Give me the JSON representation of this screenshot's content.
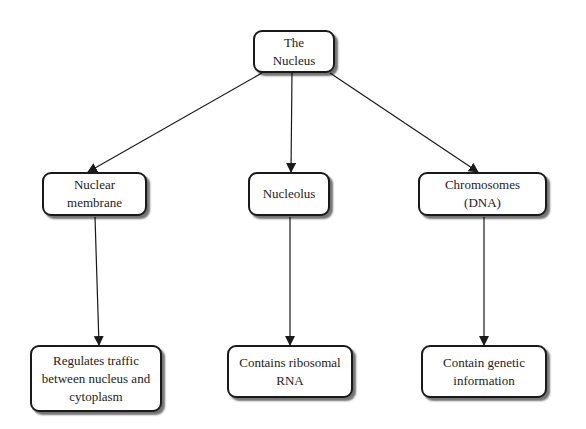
{
  "diagram": {
    "type": "tree",
    "root": {
      "id": "nucleus",
      "label": "The Nucleus"
    },
    "level1": [
      {
        "id": "membrane",
        "label": "Nuclear membrane"
      },
      {
        "id": "nucleolus",
        "label": "Nucleolus"
      },
      {
        "id": "chromosomes",
        "label": "Chromosomes (DNA)"
      }
    ],
    "level2": [
      {
        "id": "membrane-desc",
        "parent": "membrane",
        "label": "Regulates traffic\nbetween nucleus and\ncytoplasm"
      },
      {
        "id": "nucleolus-desc",
        "parent": "nucleolus",
        "label": "Contains ribosomal\nRNA"
      },
      {
        "id": "chromosomes-desc",
        "parent": "chromosomes",
        "label": "Contain genetic\ninformation"
      }
    ],
    "edges": [
      {
        "from": "nucleus",
        "to": "membrane"
      },
      {
        "from": "nucleus",
        "to": "nucleolus"
      },
      {
        "from": "nucleus",
        "to": "chromosomes"
      },
      {
        "from": "membrane",
        "to": "membrane-desc"
      },
      {
        "from": "nucleolus",
        "to": "nucleolus-desc"
      },
      {
        "from": "chromosomes",
        "to": "chromosomes-desc"
      }
    ],
    "colors": {
      "stroke": "#1a1a1a",
      "fill": "#ffffff",
      "background": "#ffffff"
    }
  }
}
